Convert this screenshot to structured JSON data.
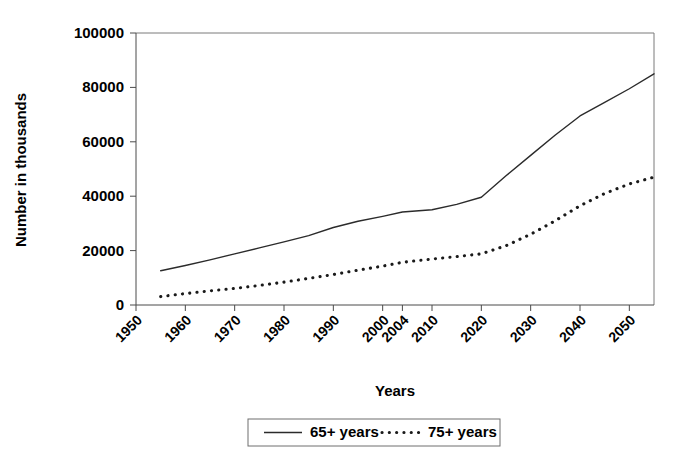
{
  "chart_data": {
    "type": "line",
    "title": "",
    "xlabel": "Years",
    "ylabel": "Number in thousands",
    "grid": false,
    "legend_position": "bottom-center",
    "xlim": [
      1950,
      2055
    ],
    "ylim": [
      0,
      100000
    ],
    "ytick_labels": [
      "100000",
      "80000",
      "60000",
      "40000",
      "20000",
      "0"
    ],
    "ytick_values": [
      100000,
      80000,
      60000,
      40000,
      20000,
      0
    ],
    "xtick_labels": [
      "1950",
      "1960",
      "1970",
      "1980",
      "1990",
      "2000",
      "2004",
      "2010",
      "2020",
      "2030",
      "2040",
      "2050"
    ],
    "xtick_values": [
      1950,
      1960,
      1970,
      1980,
      1990,
      2000,
      2004,
      2010,
      2020,
      2030,
      2040,
      2050
    ],
    "x": [
      1955,
      1960,
      1965,
      1970,
      1975,
      1980,
      1985,
      1990,
      1995,
      2000,
      2004,
      2010,
      2015,
      2020,
      2025,
      2030,
      2035,
      2040,
      2045,
      2050,
      2055
    ],
    "series": [
      {
        "name": "65+ years",
        "style": "solid",
        "color": "#2b2b2b",
        "values": [
          12600,
          14500,
          16600,
          18800,
          21000,
          23200,
          25500,
          28500,
          30800,
          32600,
          34200,
          35000,
          37000,
          39600,
          47500,
          55000,
          62500,
          69500,
          74500,
          79500,
          85000
        ]
      },
      {
        "name": "75+ years",
        "style": "dotted",
        "color": "#1a1a1a",
        "values": [
          3100,
          4200,
          5200,
          6100,
          7200,
          8400,
          9800,
          11200,
          12800,
          14300,
          15700,
          16900,
          17800,
          18800,
          21800,
          26000,
          31000,
          36500,
          41000,
          44500,
          47000
        ]
      }
    ]
  },
  "legend": {
    "entries": [
      {
        "label": "65+ years",
        "style": "solid"
      },
      {
        "label": "75+ years",
        "style": "dotted"
      }
    ]
  }
}
